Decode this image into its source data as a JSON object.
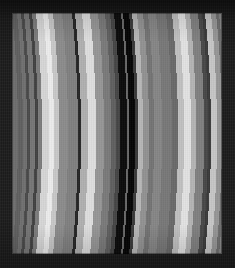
{
  "image": {
    "title": "Saturn ring radial scan",
    "kind": "grayscale-band-image",
    "width_px": 235,
    "height_px": 268,
    "frame_color": "#1d1d1d",
    "plate": {
      "left_px": 12,
      "top_px": 13,
      "width_px": 210,
      "height_px": 241,
      "base_color": "#6e6e6e"
    },
    "curvature": {
      "description": "bands bow convex toward the right, bulging about 6 px at mid-height",
      "bulge_px": 6
    }
  },
  "chart_data": {
    "type": "heatmap",
    "title": "Saturn ring radial scan",
    "subtitle": "",
    "xlabel": "",
    "ylabel": "",
    "grid": false,
    "legend": null,
    "colormap": "grayscale",
    "orientation": "vertical-bands",
    "x_units": "pixels from plate left edge",
    "value_units": "relative brightness 0-255",
    "xlim": [
      0,
      210
    ],
    "value_range": [
      6,
      236
    ],
    "bands": [
      {
        "name": "outer-c-ring-edge",
        "x": 0,
        "w": 5,
        "value": 96,
        "color": "#606060"
      },
      {
        "name": "c-ring-shelf",
        "x": 5,
        "w": 4,
        "value": 112,
        "color": "#707070"
      },
      {
        "name": "c-ring-dark-lane",
        "x": 9,
        "w": 3,
        "value": 74,
        "color": "#4a4a4a"
      },
      {
        "name": "c-ring-plateau",
        "x": 12,
        "w": 5,
        "value": 118,
        "color": "#767676"
      },
      {
        "name": "inner-ringlet-dark",
        "x": 17,
        "w": 3,
        "value": 66,
        "color": "#424242"
      },
      {
        "name": "b-ring-inner-rise",
        "x": 20,
        "w": 4,
        "value": 124,
        "color": "#7c7c7c"
      },
      {
        "name": "bright-ringlet-1",
        "x": 24,
        "w": 7,
        "value": 214,
        "color": "#d6d6d6"
      },
      {
        "name": "bright-ringlet-1-core",
        "x": 31,
        "w": 5,
        "value": 236,
        "color": "#ececec"
      },
      {
        "name": "bright-ringlet-1-outer",
        "x": 36,
        "w": 5,
        "value": 200,
        "color": "#c8c8c8"
      },
      {
        "name": "b-ring-midtone-a",
        "x": 41,
        "w": 9,
        "value": 140,
        "color": "#8c8c8c"
      },
      {
        "name": "b-ring-midtone-b",
        "x": 50,
        "w": 10,
        "value": 128,
        "color": "#808080"
      },
      {
        "name": "narrow-dark-gap-1",
        "x": 60,
        "w": 3,
        "value": 38,
        "color": "#262626"
      },
      {
        "name": "b-ring-bright-shelf",
        "x": 63,
        "w": 7,
        "value": 176,
        "color": "#b0b0b0"
      },
      {
        "name": "bright-ringlet-2",
        "x": 70,
        "w": 8,
        "value": 222,
        "color": "#dedede"
      },
      {
        "name": "b-ring-midtone-c",
        "x": 78,
        "w": 8,
        "value": 150,
        "color": "#969696"
      },
      {
        "name": "b-ring-midtone-d",
        "x": 86,
        "w": 7,
        "value": 122,
        "color": "#7a7a7a"
      },
      {
        "name": "b-ring-shadow-band",
        "x": 93,
        "w": 5,
        "value": 96,
        "color": "#606060"
      },
      {
        "name": "division-approach",
        "x": 98,
        "w": 4,
        "value": 70,
        "color": "#464646"
      },
      {
        "name": "cassini-division-dark",
        "x": 102,
        "w": 7,
        "value": 12,
        "color": "#0c0c0c"
      },
      {
        "name": "division-thin-ringlet",
        "x": 109,
        "w": 2,
        "value": 104,
        "color": "#686868"
      },
      {
        "name": "cassini-division-core",
        "x": 111,
        "w": 6,
        "value": 6,
        "color": "#060606"
      },
      {
        "name": "division-outer-edge",
        "x": 117,
        "w": 3,
        "value": 58,
        "color": "#3a3a3a"
      },
      {
        "name": "a-ring-inner-bright",
        "x": 120,
        "w": 5,
        "value": 182,
        "color": "#b6b6b6"
      },
      {
        "name": "a-ring-inner-mid",
        "x": 125,
        "w": 6,
        "value": 146,
        "color": "#929292"
      },
      {
        "name": "a-ring-lane-1",
        "x": 131,
        "w": 5,
        "value": 116,
        "color": "#747474"
      },
      {
        "name": "a-ring-plateau-1",
        "x": 136,
        "w": 8,
        "value": 134,
        "color": "#868686"
      },
      {
        "name": "a-ring-mid-gray",
        "x": 144,
        "w": 10,
        "value": 120,
        "color": "#787878"
      },
      {
        "name": "a-ring-lane-2",
        "x": 154,
        "w": 6,
        "value": 106,
        "color": "#6a6a6a"
      },
      {
        "name": "a-ring-bright-plateau",
        "x": 160,
        "w": 6,
        "value": 192,
        "color": "#c0c0c0"
      },
      {
        "name": "a-ring-bright-core",
        "x": 166,
        "w": 7,
        "value": 226,
        "color": "#e2e2e2"
      },
      {
        "name": "a-ring-bright-fall",
        "x": 173,
        "w": 5,
        "value": 180,
        "color": "#b4b4b4"
      },
      {
        "name": "a-ring-mid-gray-2",
        "x": 178,
        "w": 8,
        "value": 128,
        "color": "#808080"
      },
      {
        "name": "encke-gap-dark",
        "x": 186,
        "w": 4,
        "value": 72,
        "color": "#484848"
      },
      {
        "name": "encke-gap-core",
        "x": 190,
        "w": 3,
        "value": 58,
        "color": "#3a3a3a"
      },
      {
        "name": "a-ring-outer-bright",
        "x": 193,
        "w": 6,
        "value": 198,
        "color": "#c6c6c6"
      },
      {
        "name": "a-ring-outer-mid",
        "x": 199,
        "w": 5,
        "value": 150,
        "color": "#969696"
      },
      {
        "name": "keeler-lane",
        "x": 204,
        "w": 3,
        "value": 110,
        "color": "#6e6e6e"
      },
      {
        "name": "a-ring-outer-shelf",
        "x": 207,
        "w": 3,
        "value": 134,
        "color": "#868686"
      },
      {
        "name": "outer-a-ring-edge",
        "x": 210,
        "w": 0,
        "value": 96,
        "color": "#606060"
      }
    ]
  }
}
